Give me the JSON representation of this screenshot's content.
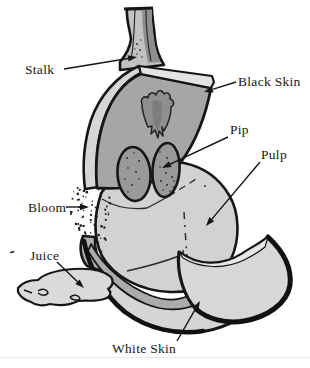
{
  "figure": {
    "canvas": {
      "width": 310,
      "height": 368,
      "background": "#ffffff",
      "ink": "#161616"
    },
    "palette": {
      "skin_face": "#a6a6a6",
      "skin_left_edge": "#d6d6d6",
      "skin_top_edge": "#e3e3e3",
      "blotch": "#8f8f8f",
      "blotch_core": "#7d7d7d",
      "stalk_light": "#c2c2c2",
      "stalk_dark": "#8e8e8e",
      "pulp": "#d2d2d2",
      "pip": "#999999",
      "bowl_inner": "#ababab",
      "bowl_face": "#d5d5d5",
      "flap_face": "#d7d7d7",
      "flap_edge": "#e7e7e7",
      "horn": "#b0b0b0",
      "juice": "#dadada"
    },
    "bloom": {
      "dot_count": 78,
      "seed": 20
    },
    "labels": [
      {
        "id": "stalk",
        "text": "Stalk",
        "tx": 25,
        "ty": 74,
        "from": [
          64,
          69
        ],
        "tip": [
          137,
          57
        ]
      },
      {
        "id": "black-skin",
        "text": "Black Skin",
        "tx": 238,
        "ty": 86,
        "from": [
          236,
          82
        ],
        "tip": [
          204,
          92
        ]
      },
      {
        "id": "pip",
        "text": "Pip",
        "tx": 230,
        "ty": 134,
        "from": [
          228,
          137
        ],
        "tip": [
          162,
          168
        ]
      },
      {
        "id": "pulp",
        "text": "Pulp",
        "tx": 261,
        "ty": 159,
        "from": [
          260,
          162
        ],
        "tip": [
          206,
          226
        ]
      },
      {
        "id": "bloom",
        "text": "Bloom",
        "tx": 28,
        "ty": 212,
        "from": [
          66,
          207
        ],
        "tip": [
          89,
          207
        ]
      },
      {
        "id": "juice",
        "text": "Juice",
        "tx": 30,
        "ty": 260,
        "from": [
          57,
          262
        ],
        "tip": [
          84,
          288
        ]
      },
      {
        "id": "white-skin",
        "text": "White Skin",
        "tx": 112,
        "ty": 353,
        "from": [
          177,
          341
        ],
        "tip": [
          200,
          301
        ]
      }
    ]
  }
}
